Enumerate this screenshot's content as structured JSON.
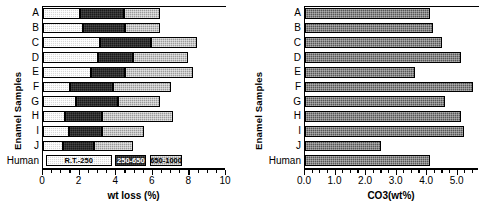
{
  "figure": {
    "panels": [
      {
        "id": "left",
        "ylabel": "Enamel  Samples",
        "xlabel": "wt loss (%)",
        "categories": [
          "A",
          "B",
          "C",
          "D",
          "E",
          "F",
          "G",
          "H",
          "I",
          "J",
          "Human"
        ],
        "xticks": [
          "0",
          "2",
          "4",
          "6",
          "8",
          "10"
        ]
      },
      {
        "id": "right",
        "ylabel": "Enamel  Samples",
        "xlabel": "CO3(wt%)",
        "categories": [
          "A",
          "B",
          "C",
          "D",
          "E",
          "F",
          "G",
          "H",
          "I",
          "J",
          "Human"
        ],
        "xticks": [
          "0.0",
          "1.0",
          "2.0",
          "3.0",
          "4.0",
          "5.0"
        ]
      }
    ]
  },
  "legend": {
    "entries": [
      {
        "label": "R.T.-250",
        "swatch": "#d8d8d8"
      },
      {
        "label": "250-650",
        "swatch": "#1b1b1b"
      },
      {
        "label": "650-1000",
        "swatch": "#9a9a9a"
      }
    ]
  },
  "chart_data": [
    {
      "type": "bar",
      "orientation": "horizontal",
      "stacked": true,
      "title": "",
      "xlabel": "wt loss (%)",
      "ylabel": "Enamel  Samples",
      "xlim": [
        0,
        10
      ],
      "xticks": [
        0,
        2,
        4,
        6,
        8,
        10
      ],
      "minor_ticks": true,
      "grid": false,
      "legend": [
        "R.T.-250",
        "250-650",
        "650-1000"
      ],
      "legend_position": "inside-bottom-row",
      "categories": [
        "A",
        "B",
        "C",
        "D",
        "E",
        "F",
        "G",
        "H",
        "I",
        "J"
      ],
      "series": [
        {
          "name": "R.T.-250",
          "values": [
            2.0,
            2.2,
            3.1,
            3.0,
            2.6,
            1.5,
            1.8,
            1.2,
            1.4,
            1.1
          ]
        },
        {
          "name": "250-650",
          "values": [
            2.4,
            2.3,
            2.8,
            1.9,
            1.9,
            2.3,
            2.3,
            2.0,
            1.8,
            1.7
          ]
        },
        {
          "name": "650-1000",
          "values": [
            2.0,
            1.9,
            2.5,
            3.0,
            3.7,
            3.2,
            2.3,
            3.9,
            2.3,
            2.1
          ]
        }
      ],
      "cumulative_totals": [
        6.4,
        6.4,
        8.4,
        7.9,
        8.2,
        7.0,
        6.4,
        7.1,
        5.5,
        4.9
      ]
    },
    {
      "type": "bar",
      "orientation": "horizontal",
      "stacked": false,
      "title": "",
      "xlabel": "CO3(wt%)",
      "ylabel": "Enamel  Samples",
      "xlim": [
        0,
        5.7
      ],
      "xticks": [
        0.0,
        1.0,
        2.0,
        3.0,
        4.0,
        5.0
      ],
      "minor_ticks": true,
      "grid": false,
      "categories": [
        "A",
        "B",
        "C",
        "D",
        "E",
        "F",
        "G",
        "H",
        "I",
        "J",
        "Human"
      ],
      "values": [
        4.1,
        4.2,
        4.5,
        5.1,
        3.6,
        5.5,
        4.6,
        5.1,
        5.2,
        2.5,
        4.1
      ]
    }
  ]
}
